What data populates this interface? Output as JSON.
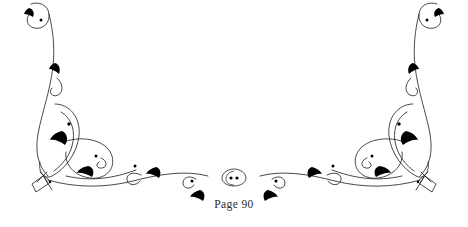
{
  "page": {
    "background_color": "#ffffff",
    "width": 468,
    "height": 227
  },
  "footer": {
    "page_label": "Page 90",
    "text_color": "#2a2a2a"
  },
  "ornament": {
    "name": "symmetric-floral-flourish-divider",
    "description": "Calligraphic double-sided scroll flourish with leaf accents, symmetric about the vertical centerline",
    "stroke_color": "#1a1a1a",
    "fill_color": "#000000",
    "stroke_width": 0.8,
    "motifs": [
      "top-terminal-hook-curl",
      "long-descending-stem",
      "teardrop-loop",
      "interlocking-oval-loop",
      "baseline-sweep",
      "ribbon-tassel-tag",
      "center-almond-with-two-dots",
      "dark-leaf-accents",
      "small-dot-accents"
    ]
  }
}
